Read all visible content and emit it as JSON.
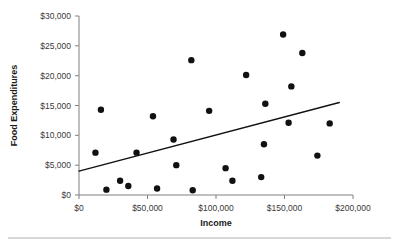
{
  "chart_data": {
    "type": "scatter",
    "title": "",
    "xlabel": "Income",
    "ylabel": "Food Expenditures",
    "xlim": [
      0,
      200000
    ],
    "ylim": [
      0,
      30000
    ],
    "grid": false,
    "legend": null,
    "x_tick_labels": [
      "$0",
      "$50,000",
      "$100,000",
      "$150,000",
      "$200,000"
    ],
    "x_tick_values": [
      0,
      50000,
      100000,
      150000,
      200000
    ],
    "y_tick_labels": [
      "$0",
      "$5,000",
      "$10,000",
      "$15,000",
      "$20,000",
      "$25,000",
      "$30,000"
    ],
    "y_tick_values": [
      0,
      5000,
      10000,
      15000,
      20000,
      25000,
      30000
    ],
    "points": [
      {
        "x": 12000,
        "y": 7100
      },
      {
        "x": 16000,
        "y": 14300
      },
      {
        "x": 20000,
        "y": 900
      },
      {
        "x": 30000,
        "y": 2400
      },
      {
        "x": 36000,
        "y": 1500
      },
      {
        "x": 42000,
        "y": 7100
      },
      {
        "x": 54000,
        "y": 13200
      },
      {
        "x": 57000,
        "y": 1100
      },
      {
        "x": 69000,
        "y": 9300
      },
      {
        "x": 71000,
        "y": 5000
      },
      {
        "x": 82000,
        "y": 22600
      },
      {
        "x": 83000,
        "y": 800
      },
      {
        "x": 95000,
        "y": 14100
      },
      {
        "x": 107000,
        "y": 4500
      },
      {
        "x": 112000,
        "y": 2400
      },
      {
        "x": 122000,
        "y": 20100
      },
      {
        "x": 133000,
        "y": 3000
      },
      {
        "x": 135000,
        "y": 8500
      },
      {
        "x": 136000,
        "y": 15300
      },
      {
        "x": 149000,
        "y": 26900
      },
      {
        "x": 153000,
        "y": 12100
      },
      {
        "x": 155000,
        "y": 18200
      },
      {
        "x": 163000,
        "y": 23800
      },
      {
        "x": 174000,
        "y": 6600
      },
      {
        "x": 183000,
        "y": 12000
      }
    ],
    "trend_line": {
      "x_start": 0,
      "y_start": 4000,
      "x_end": 190000,
      "y_end": 15500
    },
    "marker": {
      "shape": "circle",
      "color": "#111111",
      "size": 3.2
    }
  }
}
